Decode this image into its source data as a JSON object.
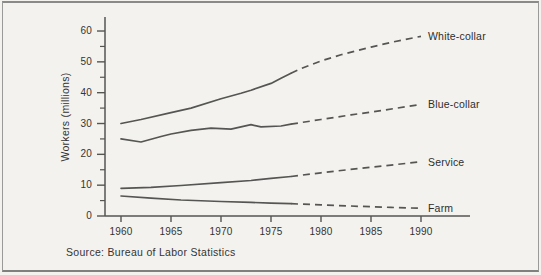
{
  "window": {
    "background": "#f3f2ef",
    "frame_border": "#8a8a88"
  },
  "chart_data": {
    "type": "line",
    "title": "",
    "ylabel": "Workers (millions)",
    "xlabel": "",
    "y_tick_labels": [
      "0",
      "10",
      "20",
      "30",
      "40",
      "50",
      "60"
    ],
    "y_tick_values": [
      0,
      10,
      20,
      30,
      40,
      50,
      60
    ],
    "y_minor_tick_values": [
      5,
      15,
      25,
      35,
      45,
      55
    ],
    "x_tick_labels": [
      "1960",
      "1965",
      "1970",
      "1975",
      "1980",
      "1985",
      "1990"
    ],
    "x_tick_values": [
      1960,
      1965,
      1970,
      1975,
      1980,
      1985,
      1990
    ],
    "xlim": [
      1958.4,
      1995
    ],
    "ylim": [
      0,
      64.5
    ],
    "grid": "off",
    "legend_position": "direct labels at right line ends",
    "line_color": "#555553",
    "label_color": "#2e2e2e",
    "dashed_meaning": "projected values (dashed after 1977)",
    "series": [
      {
        "name": "White-collar",
        "dash_from": 1977,
        "points": [
          [
            1960,
            30
          ],
          [
            1962,
            31.3
          ],
          [
            1965,
            33.5
          ],
          [
            1967,
            35
          ],
          [
            1970,
            38
          ],
          [
            1972,
            39.8
          ],
          [
            1973,
            40.8
          ],
          [
            1975,
            43
          ],
          [
            1976,
            44.7
          ],
          [
            1977,
            46.3
          ],
          [
            1978,
            47.8
          ],
          [
            1980,
            50.3
          ],
          [
            1982,
            52.3
          ],
          [
            1985,
            54.8
          ],
          [
            1987,
            56.3
          ],
          [
            1990,
            58.3
          ]
        ]
      },
      {
        "name": "Blue-collar",
        "dash_from": 1977,
        "points": [
          [
            1960,
            25
          ],
          [
            1962,
            24
          ],
          [
            1964,
            25.8
          ],
          [
            1965,
            26.6
          ],
          [
            1967,
            27.8
          ],
          [
            1969,
            28.5
          ],
          [
            1971,
            28.2
          ],
          [
            1973,
            29.6
          ],
          [
            1974,
            28.9
          ],
          [
            1976,
            29.2
          ],
          [
            1977,
            29.8
          ],
          [
            1980,
            31.3
          ],
          [
            1983,
            32.8
          ],
          [
            1986,
            34.2
          ],
          [
            1990,
            36.2
          ]
        ]
      },
      {
        "name": "Service",
        "dash_from": 1977,
        "points": [
          [
            1960,
            9
          ],
          [
            1963,
            9.3
          ],
          [
            1966,
            9.9
          ],
          [
            1970,
            10.8
          ],
          [
            1973,
            11.5
          ],
          [
            1975,
            12.2
          ],
          [
            1977,
            12.8
          ],
          [
            1980,
            14
          ],
          [
            1984,
            15.5
          ],
          [
            1987,
            16.5
          ],
          [
            1990,
            17.6
          ]
        ]
      },
      {
        "name": "Farm",
        "dash_from": 1977,
        "points": [
          [
            1960,
            6.5
          ],
          [
            1963,
            5.8
          ],
          [
            1966,
            5.2
          ],
          [
            1970,
            4.7
          ],
          [
            1973,
            4.4
          ],
          [
            1975,
            4.2
          ],
          [
            1977,
            4
          ],
          [
            1980,
            3.6
          ],
          [
            1984,
            3.1
          ],
          [
            1987,
            2.8
          ],
          [
            1990,
            2.5
          ]
        ]
      }
    ]
  },
  "source": {
    "text": "Source: Bureau of Labor Statistics"
  }
}
